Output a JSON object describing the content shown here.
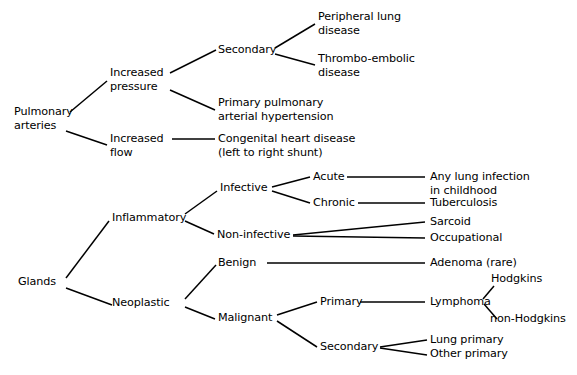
{
  "diagram": {
    "type": "tree-diagram",
    "orientation": "left-to-right",
    "background_color": "#ffffff",
    "line_color": "#000000",
    "text_color": "#000000",
    "nodes": {
      "pulmonary_arteries": "Pulmonary\narteries",
      "increased_pressure": "Increased\npressure",
      "increased_flow": "Increased\nflow",
      "secondary_pressure": "Secondary",
      "peripheral_lung_disease": "Peripheral lung\ndisease",
      "thrombo_embolic_disease": "Thrombo-embolic\ndisease",
      "primary_pulmonary_arterial_hypertension": "Primary pulmonary\narterial hypertension",
      "congenital_heart_disease": "Congenital heart disease\n(left to right shunt)",
      "glands": "Glands",
      "inflammatory": "Inflammatory",
      "neoplastic": "Neoplastic",
      "infective": "Infective",
      "non_infective": "Non-infective",
      "acute": "Acute",
      "chronic": "Chronic",
      "any_lung_infection": "Any lung infection\nin childhood",
      "tuberculosis": "Tuberculosis",
      "sarcoid": "Sarcoid",
      "occupational": "Occupational",
      "benign": "Benign",
      "malignant": "Malignant",
      "adenoma": "Adenoma (rare)",
      "primary_malignant": "Primary",
      "secondary_malignant": "Secondary",
      "lymphoma": "Lymphoma",
      "hodgkins": "Hodgkins",
      "non_hodgkins": "non-Hodgkins",
      "lung_primary": "Lung primary",
      "other_primary": "Other primary"
    },
    "edges": [
      {
        "from": "pulmonary_arteries",
        "to": "increased_pressure"
      },
      {
        "from": "pulmonary_arteries",
        "to": "increased_flow"
      },
      {
        "from": "increased_pressure",
        "to": "secondary_pressure"
      },
      {
        "from": "increased_pressure",
        "to": "primary_pulmonary_arterial_hypertension"
      },
      {
        "from": "secondary_pressure",
        "to": "peripheral_lung_disease"
      },
      {
        "from": "secondary_pressure",
        "to": "thrombo_embolic_disease"
      },
      {
        "from": "increased_flow",
        "to": "congenital_heart_disease"
      },
      {
        "from": "glands",
        "to": "inflammatory"
      },
      {
        "from": "glands",
        "to": "neoplastic"
      },
      {
        "from": "inflammatory",
        "to": "infective"
      },
      {
        "from": "inflammatory",
        "to": "non_infective"
      },
      {
        "from": "infective",
        "to": "acute"
      },
      {
        "from": "infective",
        "to": "chronic"
      },
      {
        "from": "acute",
        "to": "any_lung_infection"
      },
      {
        "from": "chronic",
        "to": "tuberculosis"
      },
      {
        "from": "non_infective",
        "to": "sarcoid"
      },
      {
        "from": "non_infective",
        "to": "occupational"
      },
      {
        "from": "neoplastic",
        "to": "benign"
      },
      {
        "from": "neoplastic",
        "to": "malignant"
      },
      {
        "from": "benign",
        "to": "adenoma"
      },
      {
        "from": "malignant",
        "to": "primary_malignant"
      },
      {
        "from": "malignant",
        "to": "secondary_malignant"
      },
      {
        "from": "primary_malignant",
        "to": "lymphoma"
      },
      {
        "from": "lymphoma",
        "to": "hodgkins"
      },
      {
        "from": "lymphoma",
        "to": "non_hodgkins"
      },
      {
        "from": "secondary_malignant",
        "to": "lung_primary"
      },
      {
        "from": "secondary_malignant",
        "to": "other_primary"
      }
    ]
  }
}
